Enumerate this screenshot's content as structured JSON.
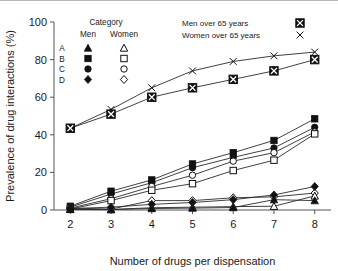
{
  "chart_data": {
    "type": "line",
    "title": "",
    "xlabel": "Number of drugs per dispensation",
    "ylabel": "Prevalence of drug interactions (%)",
    "x": [
      2,
      3,
      4,
      5,
      6,
      7,
      8
    ],
    "xlim": [
      1.6,
      8.4
    ],
    "ylim": [
      0,
      100
    ],
    "xticks": [
      "2",
      "3",
      "4",
      "5",
      "6",
      "7",
      "8"
    ],
    "yticks": [
      "0",
      "20",
      "40",
      "60",
      "80",
      "100"
    ],
    "grid": false,
    "legend_position": "top-inside",
    "series": [
      {
        "name": "Women over 65 years",
        "marker": "x",
        "group": "over65",
        "sex": "Women",
        "values": [
          43.5,
          53.5,
          65.0,
          74.0,
          79.0,
          82.0,
          84.0
        ]
      },
      {
        "name": "Men over 65 years",
        "marker": "crossed-square",
        "group": "over65",
        "sex": "Men",
        "values": [
          43.5,
          51.0,
          60.0,
          65.0,
          69.5,
          74.0,
          80.0
        ]
      },
      {
        "name": "B Men",
        "marker": "filled-square",
        "group": "B",
        "sex": "Men",
        "values": [
          2.0,
          10.0,
          16.0,
          24.5,
          30.5,
          37.0,
          48.5
        ]
      },
      {
        "name": "C Men",
        "marker": "filled-circle",
        "group": "C",
        "sex": "Men",
        "values": [
          1.5,
          8.5,
          14.5,
          22.5,
          28.0,
          33.0,
          44.0
        ]
      },
      {
        "name": "C Women",
        "marker": "open-circle",
        "group": "C",
        "sex": "Women",
        "values": [
          1.0,
          6.0,
          12.5,
          18.5,
          26.0,
          30.5,
          41.5
        ]
      },
      {
        "name": "B Women",
        "marker": "open-square",
        "group": "B",
        "sex": "Women",
        "values": [
          0.5,
          5.0,
          10.5,
          14.0,
          21.0,
          26.5,
          40.5
        ]
      },
      {
        "name": "D Women",
        "marker": "open-diamond",
        "group": "D",
        "sex": "Women",
        "values": [
          1.0,
          0.5,
          5.0,
          5.0,
          6.5,
          7.0,
          9.0
        ]
      },
      {
        "name": "D Men",
        "marker": "filled-diamond",
        "group": "D",
        "sex": "Men",
        "values": [
          0.8,
          1.5,
          3.0,
          4.0,
          5.5,
          8.0,
          12.5
        ]
      },
      {
        "name": "A Women",
        "marker": "open-triangle",
        "group": "A",
        "sex": "Women",
        "values": [
          0.4,
          0.3,
          1.2,
          1.5,
          1.8,
          2.0,
          7.5
        ]
      },
      {
        "name": "A Men",
        "marker": "filled-triangle",
        "group": "A",
        "sex": "Men",
        "values": [
          0.3,
          0.2,
          0.8,
          1.0,
          1.3,
          5.5,
          5.0
        ]
      }
    ]
  },
  "legend": {
    "category_title": "Category",
    "col_men": "Men",
    "col_women": "Women",
    "rows": [
      {
        "label": "A",
        "men_marker": "filled-triangle",
        "women_marker": "open-triangle"
      },
      {
        "label": "B",
        "men_marker": "filled-square",
        "women_marker": "open-square"
      },
      {
        "label": "C",
        "men_marker": "filled-circle",
        "women_marker": "open-circle"
      },
      {
        "label": "D",
        "men_marker": "filled-diamond",
        "women_marker": "open-diamond"
      }
    ],
    "over65": [
      {
        "label": "Men over 65 years",
        "marker": "crossed-square"
      },
      {
        "label": "Women over 65 years",
        "marker": "x"
      }
    ]
  },
  "colors": {
    "ink": "#111111",
    "axis": "#555555",
    "background": "#ffffff",
    "top_border": "#b9b9b9"
  }
}
